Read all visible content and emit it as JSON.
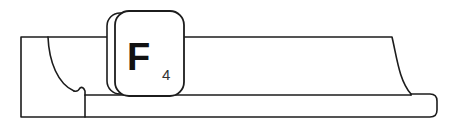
{
  "canvas": {
    "width": 453,
    "height": 133,
    "background_color": "#ffffff",
    "line_color": "#1c1c1c",
    "fill_color": "#ffffff"
  },
  "diagram": {
    "type": "technical-line-drawing"
  },
  "keycap": {
    "letter": "F",
    "subscript": "4",
    "full_label": "F4",
    "shape": "rounded-square",
    "has_back_layer": true,
    "text_color": "#111111",
    "border_color": "#1c1c1c",
    "fill_color": "#ffffff",
    "position": {
      "x": 106,
      "y": 11,
      "width": 78,
      "height": 85
    }
  },
  "geometry": {
    "upper_band": {
      "top_y": 37,
      "bottom_y": 95,
      "left_x": 21,
      "right_x": 392
    },
    "base_rail": {
      "top_y": 95,
      "bottom_y": 117,
      "left_x": 21,
      "right_x": 437,
      "corner_radius": 7
    },
    "left_cove_start_x": 48,
    "left_notch_x": 81,
    "right_cove_end_x": 411
  }
}
